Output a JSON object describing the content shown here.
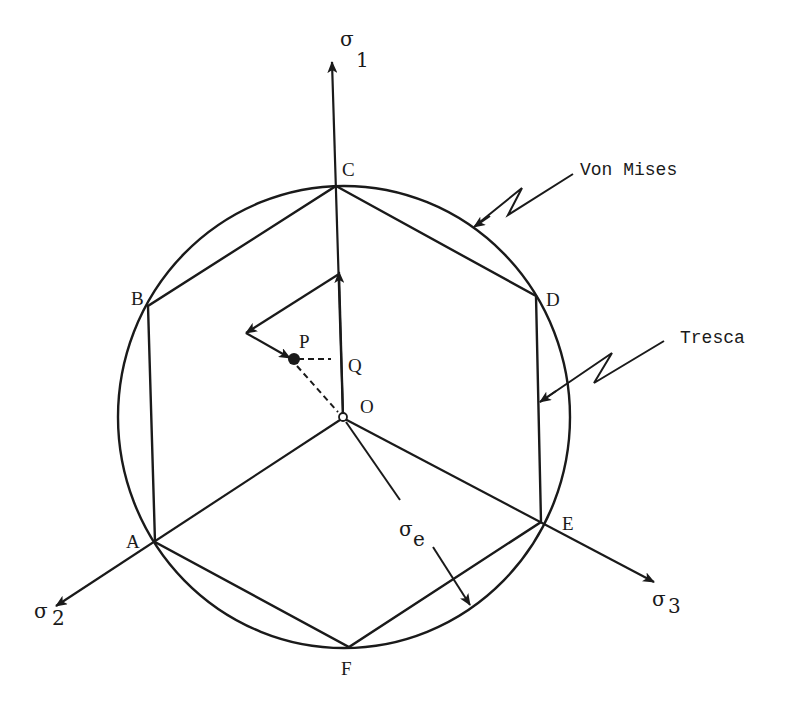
{
  "figure": {
    "stroke_color": "#1a1a1a",
    "background": "#ffffff"
  },
  "axes": {
    "sigma1": {
      "symbol": "σ",
      "subscript": "1"
    },
    "sigma2": {
      "symbol": "σ",
      "subscript": "2"
    },
    "sigma3": {
      "symbol": "σ",
      "subscript": "3"
    }
  },
  "points": {
    "A": "A",
    "B": "B",
    "C": "C",
    "D": "D",
    "E": "E",
    "F": "F",
    "O": "O",
    "P": "P",
    "Q": "Q"
  },
  "callouts": {
    "von_mises": "Von Mises",
    "tresca": "Tresca"
  },
  "radius_label": {
    "symbol": "σ",
    "subscript": "e"
  }
}
